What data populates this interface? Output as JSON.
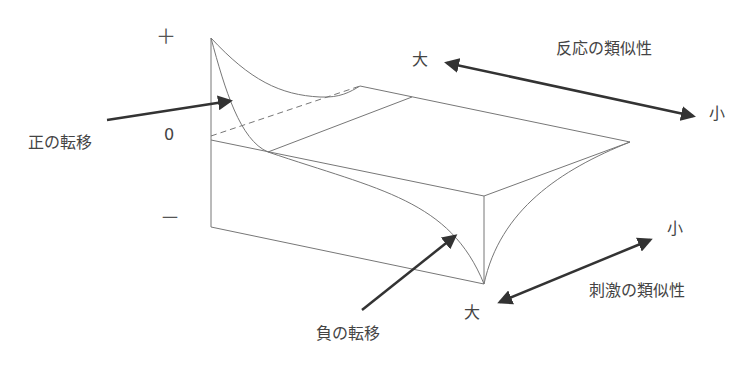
{
  "diagram": {
    "axis_symbols": {
      "plus": "＋",
      "zero": "0",
      "minus": "－"
    },
    "labels": {
      "positive_transfer": "正の転移",
      "negative_transfer": "負の転移",
      "response_similarity": "反応の類似性",
      "stimulus_similarity": "刺激の類似性",
      "response_high": "大",
      "response_low": "小",
      "stimulus_high": "大",
      "stimulus_low": "小"
    },
    "colors": {
      "line": "#666666",
      "arrow": "#333333",
      "text": "#444444"
    }
  }
}
